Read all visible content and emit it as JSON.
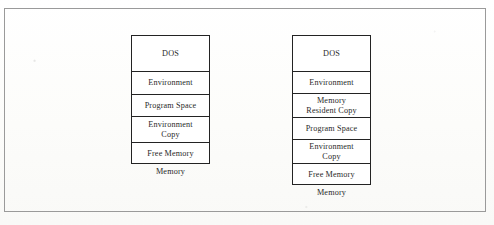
{
  "figure": {
    "background_color": "#fdfdfb",
    "frame_color": "#9a9a9a",
    "box_border_color": "#232323",
    "text_color": "#2a2a2a",
    "maps": [
      {
        "id": "before",
        "caption": "Memory",
        "rows": [
          {
            "label": "DOS"
          },
          {
            "label": "Environment"
          },
          {
            "label": "Program  Space"
          },
          {
            "label": "Environment\nCopy"
          },
          {
            "label": "Free Memory"
          }
        ]
      },
      {
        "id": "after",
        "caption": "Memory",
        "rows": [
          {
            "label": "DOS"
          },
          {
            "label": "Environment"
          },
          {
            "label": "Memory\nResident Copy"
          },
          {
            "label": "Program  Space"
          },
          {
            "label": "Environment\nCopy"
          },
          {
            "label": "Free  Memory"
          }
        ]
      }
    ]
  }
}
